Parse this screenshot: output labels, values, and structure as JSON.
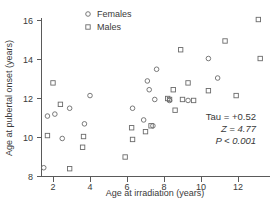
{
  "chart_data": {
    "type": "scatter",
    "title": "",
    "xlabel": "Age at irradiation (years)",
    "ylabel": "Age at pubertal onset (years)",
    "xlim": [
      0.8,
      13.6
    ],
    "ylim": [
      7.9,
      16.4
    ],
    "xticks": [
      2,
      4,
      6,
      8,
      10,
      12
    ],
    "yticks": [
      8,
      10,
      12,
      14,
      16
    ],
    "xtick_labels": [
      "2",
      "4",
      "6",
      "8",
      "10",
      "12"
    ],
    "ytick_labels": [
      "8",
      "10",
      "12",
      "14",
      "16"
    ],
    "grid": false,
    "legend_position": "top-center",
    "series": [
      {
        "name": "Females",
        "marker": "circle",
        "points": [
          [
            1.5,
            8.45
          ],
          [
            1.7,
            11.1
          ],
          [
            2.1,
            11.2
          ],
          [
            2.5,
            9.95
          ],
          [
            2.9,
            11.5
          ],
          [
            3.7,
            10.7
          ],
          [
            4.0,
            12.15
          ],
          [
            6.3,
            11.5
          ],
          [
            6.9,
            10.9
          ],
          [
            7.1,
            12.9
          ],
          [
            7.2,
            12.45
          ],
          [
            7.4,
            10.6
          ],
          [
            7.5,
            11.95
          ],
          [
            7.6,
            13.5
          ],
          [
            8.3,
            11.9
          ],
          [
            9.3,
            11.9
          ],
          [
            10.4,
            14.05
          ],
          [
            10.9,
            13.05
          ]
        ]
      },
      {
        "name": "Males",
        "marker": "square",
        "points": [
          [
            1.7,
            10.1
          ],
          [
            2.0,
            12.8
          ],
          [
            2.4,
            11.7
          ],
          [
            2.9,
            8.4
          ],
          [
            3.6,
            9.5
          ],
          [
            3.65,
            10.05
          ],
          [
            5.9,
            9.0
          ],
          [
            6.25,
            10.5
          ],
          [
            6.3,
            9.9
          ],
          [
            7.0,
            10.3
          ],
          [
            7.3,
            10.6
          ],
          [
            8.2,
            12.0
          ],
          [
            8.3,
            11.95
          ],
          [
            8.5,
            12.45
          ],
          [
            8.6,
            11.4
          ],
          [
            8.9,
            14.5
          ],
          [
            9.0,
            11.95
          ],
          [
            9.3,
            12.8
          ],
          [
            9.6,
            11.9
          ],
          [
            10.4,
            12.4
          ],
          [
            11.3,
            14.95
          ],
          [
            11.9,
            12.15
          ],
          [
            13.1,
            16.05
          ],
          [
            13.2,
            14.05
          ]
        ]
      }
    ],
    "annotations": [
      {
        "id": "tau",
        "text": "Tau = +0.52"
      },
      {
        "id": "z",
        "text": "Z = 4.77"
      },
      {
        "id": "p",
        "text": "P < 0.001"
      }
    ]
  },
  "legend": {
    "entries": [
      {
        "label": "Females",
        "marker": "circle"
      },
      {
        "label": "Males",
        "marker": "square"
      }
    ]
  },
  "colors": {
    "axis": "#5a5a5a",
    "marker": "#6b6b6b",
    "text": "#3a3a3a",
    "background": "#ffffff"
  }
}
